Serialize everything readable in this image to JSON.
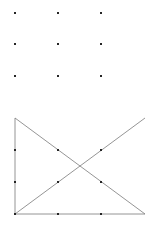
{
  "figure": {
    "canvas": {
      "width": 154,
      "height": 226
    },
    "background_color": "#ffffff",
    "dot_color": "#262626",
    "line_color": "#7a7a7a",
    "dot_size": 2.6,
    "line_width": 0.8
  },
  "top_grid": {
    "name": "3x3 dot lattice",
    "rows": 3,
    "columns": 3,
    "x_positions": [
      15,
      58,
      101
    ],
    "y_positions": [
      13,
      44,
      76
    ],
    "points": [
      {
        "x": 15,
        "y": 13
      },
      {
        "x": 58,
        "y": 13
      },
      {
        "x": 101,
        "y": 13
      },
      {
        "x": 15,
        "y": 44
      },
      {
        "x": 58,
        "y": 44
      },
      {
        "x": 101,
        "y": 44
      },
      {
        "x": 15,
        "y": 76
      },
      {
        "x": 58,
        "y": 76
      },
      {
        "x": 101,
        "y": 76
      }
    ]
  },
  "bottom_figure": {
    "name": "crossed right triangle",
    "vertices": {
      "top_left": {
        "x": 15,
        "y": 118
      },
      "bottom_left": {
        "x": 15,
        "y": 214
      },
      "bottom_right": {
        "x": 145,
        "y": 214
      },
      "top_right": {
        "x": 145,
        "y": 118
      }
    },
    "edges": [
      {
        "name": "left-vertical-edge",
        "x1": 15,
        "y1": 118,
        "x2": 15,
        "y2": 214
      },
      {
        "name": "bottom-horizontal-edge",
        "x1": 15,
        "y1": 214,
        "x2": 145,
        "y2": 214
      },
      {
        "name": "descending-diagonal",
        "x1": 15,
        "y1": 118,
        "x2": 145,
        "y2": 214
      },
      {
        "name": "ascending-diagonal",
        "x1": 15,
        "y1": 214,
        "x2": 145,
        "y2": 118
      }
    ],
    "crossing_point": {
      "x": 80,
      "y": 166
    },
    "x_positions": [
      15,
      58,
      101
    ],
    "y_positions": [
      150,
      182,
      214
    ],
    "points": [
      {
        "x": 15,
        "y": 150
      },
      {
        "x": 58,
        "y": 150
      },
      {
        "x": 101,
        "y": 150
      },
      {
        "x": 15,
        "y": 182
      },
      {
        "x": 58,
        "y": 182
      },
      {
        "x": 101,
        "y": 182
      },
      {
        "x": 15,
        "y": 214
      },
      {
        "x": 58,
        "y": 214
      },
      {
        "x": 101,
        "y": 214
      }
    ]
  }
}
